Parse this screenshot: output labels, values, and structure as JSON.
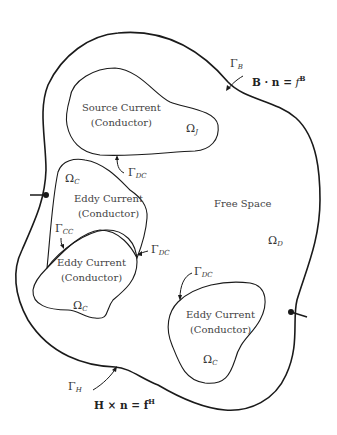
{
  "diagram": {
    "regions": [
      {
        "id": "source",
        "line1": "Source Current",
        "line2": "(Conductor)",
        "symbol": "Ω",
        "sub": "J"
      },
      {
        "id": "eddy1",
        "line1": "Eddy Current",
        "line2": "(Conductor)",
        "symbol": "Ω",
        "sub": "C"
      },
      {
        "id": "eddy2",
        "line1": "Eddy Current",
        "line2": "(Conductor)",
        "symbol": "Ω",
        "sub": "C"
      },
      {
        "id": "eddy3",
        "line1": "Eddy Current",
        "line2": "(Conductor)",
        "symbol": "Ω",
        "sub": "C"
      }
    ],
    "free_space": {
      "label": "Free Space",
      "symbol": "Ω",
      "sub": "D"
    },
    "boundaries": {
      "gamma_b": {
        "symbol": "Γ",
        "sub": "B",
        "equation_left": "B · n = ",
        "equation_f": "f",
        "equation_sup": "B"
      },
      "gamma_h": {
        "symbol": "Γ",
        "sub": "H",
        "equation": "H × n = f",
        "equation_sup": "H"
      },
      "gamma_dc_1": {
        "symbol": "Γ",
        "sub": "DC"
      },
      "gamma_dc_2": {
        "symbol": "Γ",
        "sub": "DC"
      },
      "gamma_dc_3": {
        "symbol": "Γ",
        "sub": "DC"
      },
      "gamma_cc": {
        "symbol": "Γ",
        "sub": "CC"
      }
    },
    "stroke_color": "#1a1a1a"
  }
}
